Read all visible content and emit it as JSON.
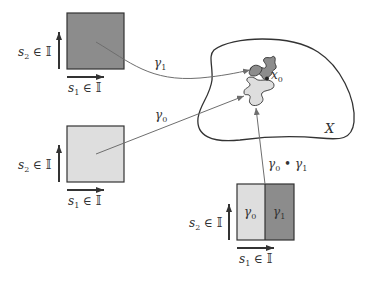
{
  "colors": {
    "dark_fill": "#8c8c8c",
    "light_fill": "#dedede",
    "stroke": "#333333",
    "arrow": "#6e6e6e",
    "background": "#ffffff"
  },
  "squares": [
    {
      "id": "gamma1-domain",
      "fill": "dark",
      "axis_s1": {
        "var": "s",
        "sub": "1",
        "rest": " ∈ 𝕀"
      },
      "axis_s2": {
        "var": "s",
        "sub": "2",
        "rest": " ∈ 𝕀"
      }
    },
    {
      "id": "gamma0-domain",
      "fill": "light",
      "axis_s1": {
        "var": "s",
        "sub": "1",
        "rest": " ∈ 𝕀"
      },
      "axis_s2": {
        "var": "s",
        "sub": "2",
        "rest": " ∈ 𝕀"
      }
    },
    {
      "id": "concat-domain",
      "fill": "split",
      "left_label": {
        "var": "γ",
        "sub": "0"
      },
      "right_label": {
        "var": "γ",
        "sub": "1"
      },
      "axis_s1": {
        "var": "s",
        "sub": "1",
        "rest": " ∈ 𝕀"
      },
      "axis_s2": {
        "var": "s",
        "sub": "2",
        "rest": " ∈ 𝕀"
      }
    }
  ],
  "maps": [
    {
      "label_var": "γ",
      "label_sub": "1",
      "from": "gamma1-domain",
      "to": "dark-blob"
    },
    {
      "label_var": "γ",
      "label_sub": "0",
      "from": "gamma0-domain",
      "to": "light-blob"
    },
    {
      "label": "γ0 • γ1",
      "label_a_var": "γ",
      "label_a_sub": "0",
      "op": " • ",
      "label_b_var": "γ",
      "label_b_sub": "1",
      "from": "concat-domain",
      "to": "light-blob"
    }
  ],
  "space": {
    "label": "X"
  },
  "basepoint": {
    "var": "x",
    "sub": "0"
  }
}
